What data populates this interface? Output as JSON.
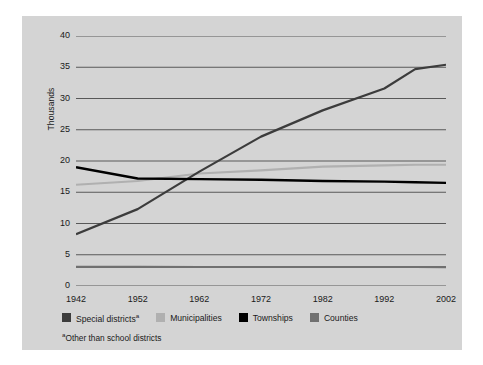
{
  "chart_data": {
    "type": "line",
    "title": "",
    "xlabel": "",
    "ylabel": "Thousands",
    "x": [
      1942,
      1952,
      1962,
      1972,
      1982,
      1992,
      1997,
      2002
    ],
    "xlim": [
      1942,
      2002
    ],
    "ylim": [
      0,
      40
    ],
    "ytick_values": [
      0,
      5,
      10,
      15,
      20,
      25,
      30,
      35,
      40
    ],
    "ytick_labels": [
      "0",
      "5",
      "10",
      "15",
      "20",
      "25",
      "30",
      "35",
      "40"
    ],
    "xtick_labels": [
      "1942",
      "1952",
      "1962",
      "1972",
      "1982",
      "1992",
      "2002"
    ],
    "xtick_values": [
      1942,
      1952,
      1962,
      1972,
      1982,
      1992,
      2002
    ],
    "grid": true,
    "grid_axis": "y",
    "legend_position": "below",
    "series": [
      {
        "name": "Special districts",
        "footnote_marker": "a",
        "color": "#3c3c3c",
        "width": 2.2,
        "values": [
          8.3,
          12.3,
          18.3,
          23.9,
          28.1,
          31.6,
          34.7,
          35.4
        ]
      },
      {
        "name": "Municipalities",
        "color": "#b0b0b0",
        "width": 2.2,
        "values": [
          16.2,
          16.8,
          18.0,
          18.5,
          19.1,
          19.3,
          19.4,
          19.4
        ]
      },
      {
        "name": "Townships",
        "color": "#000000",
        "width": 2.4,
        "values": [
          19.0,
          17.2,
          17.1,
          17.0,
          16.8,
          16.7,
          16.6,
          16.5
        ]
      },
      {
        "name": "Counties",
        "color": "#707070",
        "width": 2.2,
        "values": [
          3.05,
          3.05,
          3.04,
          3.04,
          3.04,
          3.04,
          3.04,
          3.03
        ]
      }
    ]
  },
  "axis": {
    "y_title": "Thousands"
  },
  "legend": {
    "entries": [
      {
        "label": "Special districts",
        "marker": "a",
        "swatch": "#3c3c3c"
      },
      {
        "label": "Municipalities",
        "marker": "",
        "swatch": "#b0b0b0"
      },
      {
        "label": "Townships",
        "marker": "",
        "swatch": "#000000"
      },
      {
        "label": "Counties",
        "marker": "",
        "swatch": "#707070"
      }
    ]
  },
  "footnote": {
    "marker": "a",
    "text": "Other than school districts"
  },
  "colors": {
    "figure_background": "#d4d4d4",
    "page_background": "#ffffff",
    "gridline": "#585858",
    "text": "#1a1a1a"
  }
}
